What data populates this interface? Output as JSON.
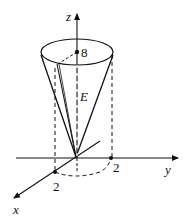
{
  "figure": {
    "axes": {
      "x_label": "x",
      "y_label": "y",
      "z_label": "z"
    },
    "labels": {
      "height_value": "8",
      "region_label": "E",
      "x_radius_value": "2",
      "y_radius_value": "2"
    },
    "colors": {
      "stroke": "#111111",
      "background": "#ffffff"
    }
  }
}
